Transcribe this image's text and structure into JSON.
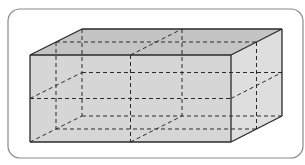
{
  "diagram": {
    "frame": {
      "x": 8,
      "y": 9,
      "w": 295,
      "h": 149,
      "radius": 12,
      "stroke": "#8a8a8a"
    },
    "colors": {
      "front_face": "#d6d6d6",
      "top_face": "#c4c4c4",
      "right_face": "#dedede",
      "edge": "#2a2a2a",
      "dash": "#2a2a2a"
    },
    "vertices": {
      "front_top_left": [
        30,
        55
      ],
      "front_top_right": [
        231,
        55
      ],
      "front_bottom_left": [
        30,
        142
      ],
      "front_bottom_right": [
        231,
        142
      ],
      "back_top_left": [
        82,
        29
      ],
      "back_top_right": [
        282,
        29
      ],
      "back_bottom_right": [
        282,
        116
      ],
      "back_bottom_left": [
        82,
        116
      ]
    }
  }
}
